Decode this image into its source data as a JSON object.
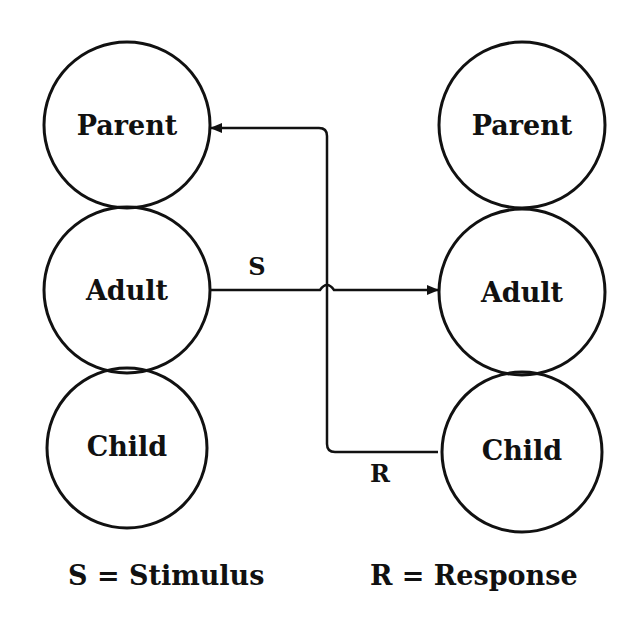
{
  "diagram": {
    "type": "transactional-analysis-crossed-transaction",
    "left_person": {
      "states": [
        {
          "label": "Parent",
          "cx": 127,
          "cy": 125
        },
        {
          "label": "Adult",
          "cx": 127,
          "cy": 290
        },
        {
          "label": "Child",
          "cx": 127,
          "cy": 448
        }
      ]
    },
    "right_person": {
      "states": [
        {
          "label": "Parent",
          "cx": 522,
          "cy": 125
        },
        {
          "label": "Adult",
          "cx": 522,
          "cy": 292
        },
        {
          "label": "Child",
          "cx": 522,
          "cy": 452
        }
      ]
    },
    "radius": 83,
    "arrows": [
      {
        "label": "S",
        "from": "left.Adult",
        "to": "right.Adult"
      },
      {
        "label": "R",
        "from": "right.Child",
        "to": "left.Parent"
      }
    ],
    "stimulus_label": "S",
    "response_label": "R",
    "legend": {
      "stimulus": "S = Stimulus",
      "response": "R = Response"
    },
    "colors": {
      "stroke": "#111111",
      "background": "#ffffff"
    }
  }
}
